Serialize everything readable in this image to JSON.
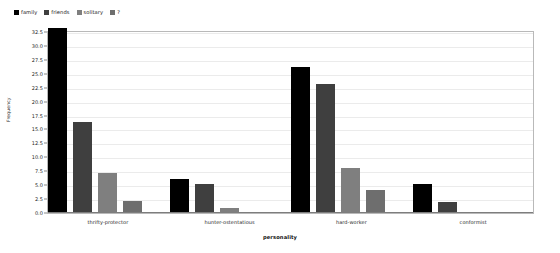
{
  "chart_data": {
    "type": "bar",
    "title": "",
    "xlabel": "personality",
    "ylabel": "Frequency",
    "categories": [
      "thrifty-protector",
      "hunter-ostentatious",
      "hard-worker",
      "conformist"
    ],
    "series": [
      {
        "name": "family",
        "color": "#000000",
        "values": [
          33,
          6,
          26,
          5
        ]
      },
      {
        "name": "friends",
        "color": "#3f3f3f",
        "values": [
          16.2,
          5,
          22.9,
          1.8
        ]
      },
      {
        "name": "solitary",
        "color": "#7f7f7f",
        "values": [
          7,
          0.8,
          7.9,
          0
        ]
      },
      {
        "name": "?",
        "color": "#6e6e6e",
        "values": [
          2,
          0,
          4,
          0
        ]
      }
    ],
    "ylim": [
      0,
      32.5
    ],
    "ytick_labels": [
      "32.5",
      "30.0",
      "27.5",
      "25.0",
      "22.5",
      "20.0",
      "17.5",
      "15.0",
      "12.5",
      "10.0",
      "7.5",
      "5.0",
      "2.5",
      "0.0"
    ],
    "ytick_values": [
      32.5,
      30.0,
      27.5,
      25.0,
      22.5,
      20.0,
      17.5,
      15.0,
      12.5,
      10.0,
      7.5,
      5.0,
      2.5,
      0.0
    ],
    "grid": true,
    "grid_axis": "y",
    "legend_position": "top-left",
    "legend_entries": [
      "family",
      "friends",
      "solitary",
      "?"
    ],
    "frame_color": "#b9b9b9",
    "grid_color": "#ebebeb",
    "background_color": "#ffffff"
  }
}
